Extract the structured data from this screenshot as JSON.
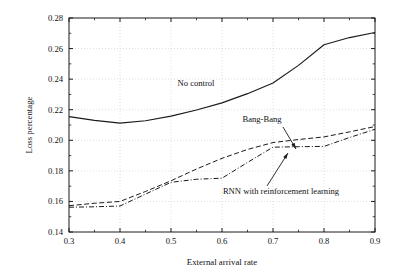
{
  "chart_data": {
    "type": "line",
    "title": "",
    "xlabel": "External arrival rate",
    "ylabel": "Loss percentage",
    "xlim": [
      0.3,
      0.9
    ],
    "ylim": [
      0.14,
      0.28
    ],
    "xticks": [
      "0.3",
      "0.4",
      "0.5",
      "0.6",
      "0.7",
      "0.8",
      "0.9"
    ],
    "xtick_values": [
      0.3,
      0.4,
      0.5,
      0.6,
      0.7,
      0.8,
      0.9
    ],
    "yticks": [
      "0.14",
      "0.16",
      "0.18",
      "0.20",
      "0.22",
      "0.24",
      "0.26",
      "0.28"
    ],
    "ytick_values": [
      0.14,
      0.16,
      0.18,
      0.2,
      0.22,
      0.24,
      0.26,
      0.28
    ],
    "grid": "dotted-major-both",
    "legend_position": "inline-annotations",
    "x": [
      0.3,
      0.35,
      0.4,
      0.45,
      0.5,
      0.55,
      0.6,
      0.65,
      0.7,
      0.75,
      0.8,
      0.85,
      0.9
    ],
    "series": [
      {
        "name": "No control",
        "style": "solid",
        "color": "#1a1a1a",
        "values": [
          0.2155,
          0.213,
          0.2112,
          0.2128,
          0.2158,
          0.2198,
          0.2245,
          0.2305,
          0.2375,
          0.249,
          0.2625,
          0.2672,
          0.2705
        ]
      },
      {
        "name": "Bang-Bang",
        "style": "dashed",
        "color": "#1a1a1a",
        "values": [
          0.1572,
          0.1588,
          0.16,
          0.1665,
          0.1735,
          0.1812,
          0.1882,
          0.194,
          0.1985,
          0.2005,
          0.2022,
          0.2055,
          0.209
        ]
      },
      {
        "name": "RNN with reinforcement learning",
        "style": "dashdot",
        "color": "#1a1a1a",
        "values": [
          0.1562,
          0.1565,
          0.157,
          0.1648,
          0.1725,
          0.1745,
          0.1752,
          0.1855,
          0.1955,
          0.1958,
          0.196,
          0.2018,
          0.2072
        ]
      }
    ],
    "annotations": [
      {
        "label": "No control",
        "x_px": 196,
        "y_px": 86,
        "leader": false
      },
      {
        "label": "Bang-Bang",
        "x_px": 262,
        "y_px": 122,
        "leader": true,
        "leader_from": [
          283,
          127
        ],
        "leader_to": [
          296,
          149
        ]
      },
      {
        "label": "RNN with reinforcement learning",
        "x_px": 281,
        "y_px": 194,
        "leader": true,
        "leader_from": [
          267,
          186
        ],
        "leader_to": [
          288,
          153
        ]
      }
    ]
  },
  "axes": {
    "plot_left_px": 69,
    "plot_right_px": 375,
    "plot_top_px": 18,
    "plot_bottom_px": 232
  }
}
